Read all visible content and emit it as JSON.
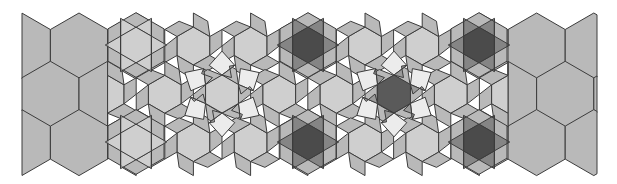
{
  "figure": {
    "width": 617,
    "height": 184,
    "colors": {
      "background": "#ffffff",
      "base_fill": "#b9b9b9",
      "light_fill": "#cfcfcf",
      "pale_fill": "#ececec",
      "mid_fill": "#9a9a9a",
      "dark_fill": "#5a5a5a",
      "darker_fill": "#4b4b4b",
      "stroke": "#3c3c3c"
    },
    "geometry": {
      "left_x": 22,
      "right_x": 597,
      "top_y": 13,
      "big_hex_half_width": 28.6,
      "big_hex_side": 33,
      "row_pitch": 48.3,
      "small_unit": 16.5
    },
    "regions": {
      "left_plain_columns": 2,
      "right_plain_columns": 2,
      "star_centers": [
        {
          "name": "light-star",
          "x": 222,
          "y": 94,
          "center_fill": "light_fill",
          "ray_fill": "pale_fill"
        },
        {
          "name": "dark-star",
          "x": 394,
          "y": 94,
          "center_fill": "dark_fill",
          "ray_fill": "pale_fill"
        }
      ],
      "hexagram_motifs": [
        {
          "name": "hexagram-top-left",
          "x": 136,
          "y": 45,
          "fill": "light_fill",
          "tone": "light"
        },
        {
          "name": "hexagram-bottom-left",
          "x": 136,
          "y": 142,
          "fill": "light_fill",
          "tone": "light"
        },
        {
          "name": "hexagram-top-mid",
          "x": 308,
          "y": 45,
          "fill": "dark_fill",
          "tone": "dark"
        },
        {
          "name": "hexagram-bottom-mid",
          "x": 308,
          "y": 142,
          "fill": "dark_fill",
          "tone": "dark"
        },
        {
          "name": "hexagram-top-right",
          "x": 479,
          "y": 45,
          "fill": "dark_fill",
          "tone": "dark"
        },
        {
          "name": "hexagram-bottom-right",
          "x": 479,
          "y": 142,
          "fill": "dark_fill",
          "tone": "dark"
        }
      ]
    }
  }
}
